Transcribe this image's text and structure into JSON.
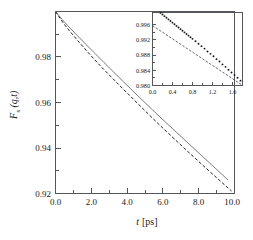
{
  "figure": {
    "kind": "scientific-plot",
    "background_color": "#ffffff",
    "axis_color": "#55565a",
    "data_color": "#23242a",
    "fit_color": "#6b6d72"
  },
  "chart_data": {
    "type": "line",
    "title": "",
    "xlabel": "t [ps]",
    "xlabel_parts": {
      "symbol": "t",
      "unit": "[ps]"
    },
    "ylabel": "F_s (q,t)",
    "ylabel_parts": {
      "base": "F",
      "subscript": "s",
      "arg": "(q,t)"
    },
    "xlim": [
      0.0,
      10.0
    ],
    "ylim": [
      0.92,
      1.0
    ],
    "xticks": [
      0.0,
      2.0,
      4.0,
      6.0,
      8.0,
      10.0
    ],
    "xtick_labels": [
      "0.0",
      "2.0",
      "4.0",
      "6.0",
      "8.0",
      "10.0"
    ],
    "xticks_minor": [
      1.0,
      3.0,
      5.0,
      7.0,
      9.0
    ],
    "yticks": [
      0.98,
      0.96,
      0.94,
      0.92
    ],
    "ytick_labels": [
      "0.98",
      "0.96",
      "0.94",
      "0.92"
    ],
    "grid": false,
    "legend": "none",
    "series": [
      {
        "name": "simulation",
        "style": "dashed",
        "color": "#23242a",
        "x": [
          0.0,
          0.25,
          0.5,
          0.75,
          1.0,
          1.5,
          2.0,
          2.5,
          3.0,
          3.5,
          4.0,
          4.5,
          5.0,
          5.5,
          6.0,
          6.5,
          7.0,
          7.5,
          8.0,
          8.5,
          9.0,
          9.5,
          10.0
        ],
        "y": [
          1.0,
          0.9977,
          0.9958,
          0.9942,
          0.9929,
          0.9903,
          0.9878,
          0.9853,
          0.9828,
          0.9804,
          0.9779,
          0.9754,
          0.9729,
          0.9704,
          0.9679,
          0.9654,
          0.9629,
          0.9603,
          0.9578,
          0.9552,
          0.9526,
          0.95,
          0.9212
        ]
      },
      {
        "name": "gaussian-approximation",
        "style": "solid",
        "color": "#6b6d72",
        "x": [
          0.0,
          0.25,
          0.5,
          0.75,
          1.0,
          1.5,
          2.0,
          3.0,
          4.0,
          5.0,
          6.0,
          7.0,
          8.0,
          9.0,
          10.0
        ],
        "y": [
          1.0,
          0.9988,
          0.9974,
          0.996,
          0.9946,
          0.9917,
          0.9889,
          0.9834,
          0.9781,
          0.9729,
          0.9678,
          0.9628,
          0.9578,
          0.9529,
          0.9481
        ]
      }
    ]
  },
  "inset_chart_data": {
    "type": "scatter",
    "title": "",
    "xlabel": "",
    "ylabel": "",
    "xlim": [
      0.0,
      1.8
    ],
    "ylim": [
      0.98,
      0.998
    ],
    "xticks": [
      0.0,
      0.4,
      0.8,
      1.2,
      1.6
    ],
    "xtick_labels": [
      "0.0",
      "0.4",
      "0.8",
      "1.2",
      "1.6"
    ],
    "xticks_minor": [
      0.2,
      0.6,
      1.0,
      1.4,
      1.8
    ],
    "yticks": [
      0.996,
      0.992,
      0.988,
      0.984,
      0.98
    ],
    "ytick_labels": [
      "0.996",
      "0.992",
      "0.988",
      "0.984",
      "0.980"
    ],
    "grid": false,
    "legend": "none",
    "series": [
      {
        "name": "simulation-points",
        "style": "dots",
        "color": "#15161a",
        "x": [
          0.04,
          0.08,
          0.12,
          0.16,
          0.2,
          0.24,
          0.28,
          0.32,
          0.36,
          0.4,
          0.44,
          0.48,
          0.52,
          0.56,
          0.6,
          0.64,
          0.68,
          0.72,
          0.76,
          0.8,
          0.86,
          0.92,
          0.98,
          1.04,
          1.1,
          1.16,
          1.22,
          1.28,
          1.34,
          1.4,
          1.46,
          1.52,
          1.58,
          1.64,
          1.7,
          1.76
        ],
        "y": [
          0.9993,
          0.9988,
          0.9983,
          0.9979,
          0.9975,
          0.9971,
          0.9967,
          0.9963,
          0.9959,
          0.9955,
          0.9951,
          0.9947,
          0.9943,
          0.9939,
          0.9935,
          0.9931,
          0.9927,
          0.9923,
          0.9919,
          0.9915,
          0.9909,
          0.9903,
          0.9897,
          0.9891,
          0.9884,
          0.9878,
          0.9872,
          0.9865,
          0.9859,
          0.9852,
          0.9846,
          0.9839,
          0.9832,
          0.9826,
          0.9819,
          0.9812
        ]
      },
      {
        "name": "linear-fit",
        "style": "dashed",
        "color": "#3a3b40",
        "x": [
          0.0,
          1.8
        ],
        "y": [
          0.9959,
          0.98
        ]
      }
    ]
  }
}
